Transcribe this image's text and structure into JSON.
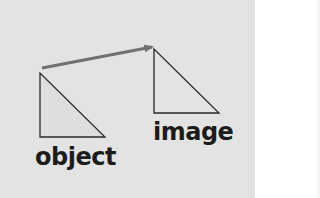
{
  "diagram": {
    "labels": {
      "object": "object",
      "image": "image"
    },
    "colors": {
      "background": "#e3e3e3",
      "arrow": "#707070",
      "triangle_stroke": "#2a2a2a",
      "text": "#1c1c1c"
    },
    "shapes": {
      "object_triangle": "right-triangle",
      "image_triangle": "right-triangle",
      "arrow": "arrow-object-to-image"
    }
  }
}
